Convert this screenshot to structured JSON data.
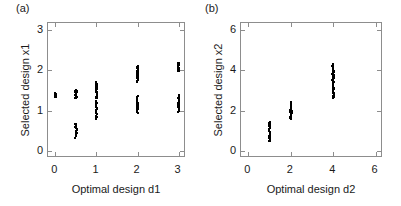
{
  "figure": {
    "background": "#ffffff",
    "marker_color": "#000000",
    "axis_color": "#8d8d8d",
    "text_color": "#1a1a1a"
  },
  "panels": {
    "a": {
      "label": "(a)",
      "xlabel": "Optimal design d1",
      "ylabel": "Selected design x1"
    },
    "b": {
      "label": "(b)",
      "xlabel": "Optimal design d2",
      "ylabel": "Selected design x2"
    }
  },
  "chart_data": [
    {
      "type": "scatter",
      "panel": "(a)",
      "title": "",
      "xlabel": "Optimal design d1",
      "ylabel": "Selected design x1",
      "xlim": [
        -0.18,
        3.18
      ],
      "ylim": [
        -0.18,
        3.18
      ],
      "xticks": [
        0,
        1,
        2,
        3
      ],
      "yticks": [
        0,
        1,
        2,
        3
      ],
      "xticklabels": [
        "0",
        "1",
        "2",
        "3"
      ],
      "yticklabels": [
        "0",
        "1",
        "2",
        "3"
      ],
      "grid": false,
      "legend": null,
      "marker": "dot",
      "clusters": [
        {
          "x": 0.0,
          "y_min": 1.33,
          "y_max": 1.45,
          "n": 14
        },
        {
          "x": 0.5,
          "y_min": 1.3,
          "y_max": 1.52,
          "n": 20
        },
        {
          "x": 0.5,
          "y_min": 0.33,
          "y_max": 0.68,
          "n": 14
        },
        {
          "x": 1.0,
          "y_min": 1.3,
          "y_max": 1.7,
          "n": 22
        },
        {
          "x": 1.0,
          "y_min": 0.8,
          "y_max": 1.22,
          "n": 22
        },
        {
          "x": 2.0,
          "y_min": 1.72,
          "y_max": 2.12,
          "n": 22
        },
        {
          "x": 2.0,
          "y_min": 0.95,
          "y_max": 1.38,
          "n": 22
        },
        {
          "x": 3.0,
          "y_min": 1.98,
          "y_max": 2.2,
          "n": 16
        },
        {
          "x": 3.0,
          "y_min": 0.98,
          "y_max": 1.38,
          "n": 20
        }
      ]
    },
    {
      "type": "scatter",
      "panel": "(b)",
      "title": "",
      "xlabel": "Optimal design d2",
      "ylabel": "Selected design x2",
      "xlim": [
        -0.35,
        6.35
      ],
      "ylim": [
        -0.35,
        6.35
      ],
      "xticks": [
        0,
        2,
        4,
        6
      ],
      "yticks": [
        0,
        2,
        4,
        6
      ],
      "xticklabels": [
        "0",
        "2",
        "4",
        "6"
      ],
      "yticklabels": [
        "0",
        "2",
        "4",
        "6"
      ],
      "grid": false,
      "legend": null,
      "marker": "dot",
      "clusters": [
        {
          "x": 1.0,
          "y_min": 0.48,
          "y_max": 1.42,
          "n": 34
        },
        {
          "x": 2.0,
          "y_min": 1.6,
          "y_max": 2.42,
          "n": 30
        },
        {
          "x": 4.0,
          "y_min": 2.62,
          "y_max": 4.3,
          "n": 60
        }
      ]
    }
  ]
}
